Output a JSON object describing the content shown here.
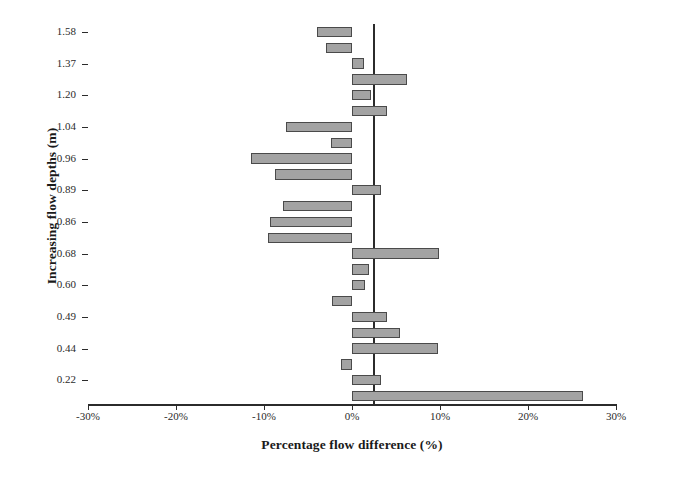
{
  "chart_data": {
    "type": "bar",
    "orientation": "horizontal",
    "title": "",
    "xlabel": "Percentage flow difference (%)",
    "ylabel": "Increasing flow depths (m)",
    "xlim": [
      -30,
      30
    ],
    "xticks": [
      -30,
      -20,
      -10,
      0,
      10,
      20,
      30
    ],
    "xticklabels": [
      "-30%",
      "-20%",
      "-10%",
      "0%",
      "10%",
      "20%",
      "30%"
    ],
    "grid": false,
    "legend": false,
    "zero_line": 0,
    "bar_color": "#a3a3a3",
    "bar_edge_color": "#4a4a4a",
    "ytick_labels": [
      "1.58",
      "1.37",
      "1.20",
      "1.04",
      "0.96",
      "0.89",
      "0.86",
      "0.68",
      "0.60",
      "0.49",
      "0.44",
      "0.22"
    ],
    "ytick_bar_index": [
      0,
      2,
      4,
      6,
      8,
      10,
      12,
      14,
      16,
      18,
      20,
      22
    ],
    "categories": [
      "1.58a",
      "1.58b",
      "1.37a",
      "1.37b",
      "1.20a",
      "1.20b",
      "1.04a",
      "1.04b",
      "0.96a",
      "0.96b",
      "0.89a",
      "0.89b",
      "0.86a",
      "0.86b",
      "0.68a",
      "0.68b",
      "0.60a",
      "0.60b",
      "0.49a",
      "0.49b",
      "0.44a",
      "0.44b",
      "0.22a",
      "0.22b"
    ],
    "values": [
      -4.0,
      -2.9,
      1.4,
      6.2,
      2.2,
      4.0,
      -7.5,
      -2.4,
      -11.5,
      -8.8,
      3.3,
      -7.8,
      -9.3,
      -9.6,
      9.9,
      1.9,
      1.5,
      -2.3,
      4.0,
      5.5,
      9.8,
      -1.2,
      3.3,
      26.3
    ]
  }
}
